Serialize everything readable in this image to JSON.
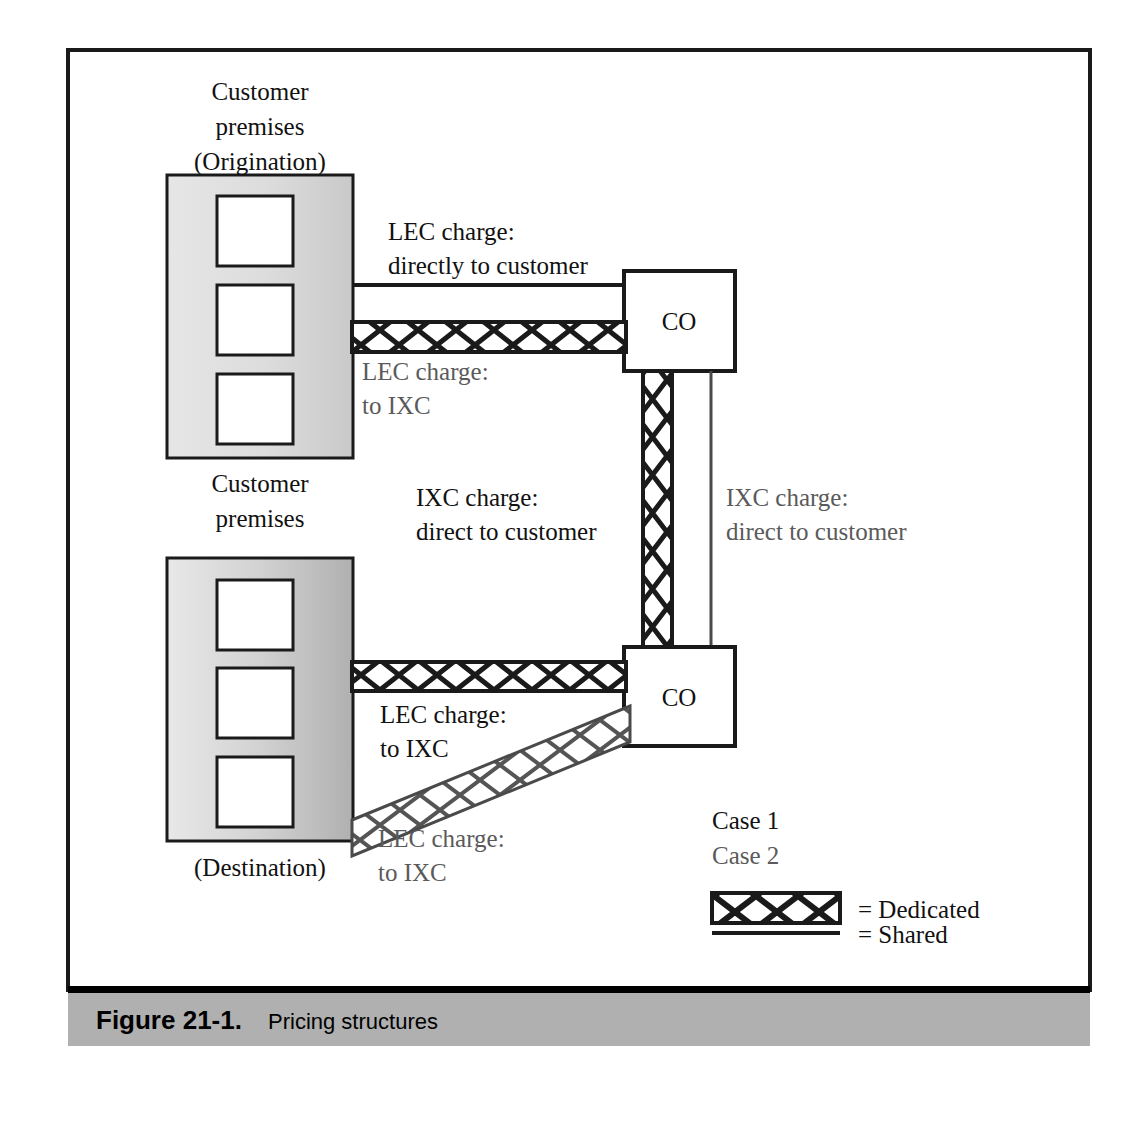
{
  "figure": {
    "caption_number": "Figure 21-1.",
    "caption_title": "Pricing structures"
  },
  "nodes": {
    "premises_top": {
      "label_line1": "Customer",
      "label_line2": "premises",
      "label_line3": "(Origination)"
    },
    "premises_bottom": {
      "label_line1": "Customer",
      "label_line2": "premises",
      "label_line3": "(Destination)"
    },
    "co_top": {
      "label": "CO"
    },
    "co_bottom": {
      "label": "CO"
    }
  },
  "annotations": {
    "lec_top_shared_line1": "LEC charge:",
    "lec_top_shared_line2": "directly to customer",
    "lec_top_dedicated_line1": "LEC charge:",
    "lec_top_dedicated_line2": "to IXC",
    "ixc_dedicated_line1": "IXC charge:",
    "ixc_dedicated_line2": "direct to customer",
    "ixc_shared_line1": "IXC charge:",
    "ixc_shared_line2": "direct to customer",
    "lec_bottom_dedicated_line1": "LEC charge:",
    "lec_bottom_dedicated_line2": "to IXC",
    "lec_bottom_diagonal_line1": "LEC charge:",
    "lec_bottom_diagonal_line2": "to IXC"
  },
  "legend": {
    "case1": "Case 1",
    "case2": "Case 2",
    "dedicated": "= Dedicated",
    "shared": "= Shared"
  },
  "colors": {
    "case1_text": "#111111",
    "case2_text": "#5a5a5a",
    "building_fill_light": "#e4e4e4",
    "building_fill_dark": "#b4b4b4",
    "caption_bar": "#b0b0b0",
    "line": "#1a1a1a"
  }
}
